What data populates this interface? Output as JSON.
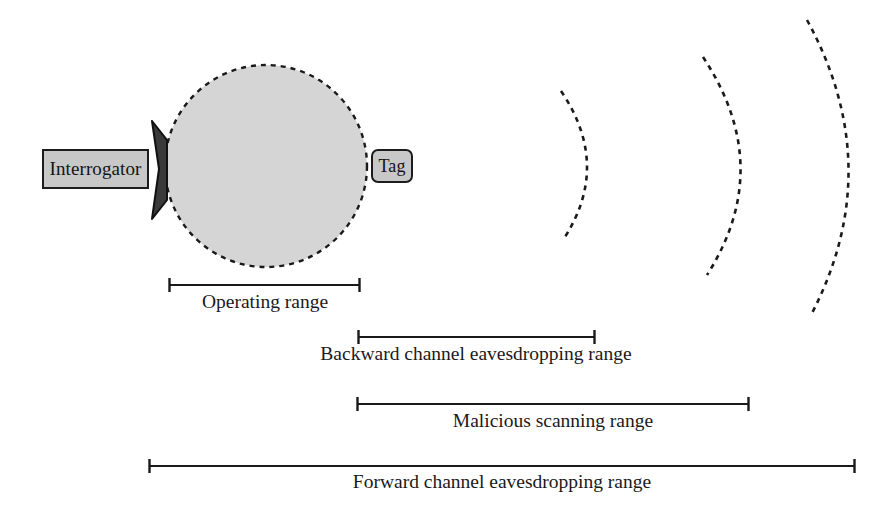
{
  "diagram": {
    "background_color": "#ffffff",
    "line_color": "#1a1a1a",
    "field_fill_color": "#d5d5d5",
    "node_fill_color": "#c8c8c8",
    "node_border_color": "#1c1c1c",
    "nodes": [
      {
        "id": "interrogator",
        "label": "Interrogator",
        "shape": "rectangle"
      },
      {
        "id": "tag",
        "label": "Tag",
        "shape": "rounded-rectangle"
      }
    ],
    "operating_field": {
      "shape": "dashed-circle",
      "center_x": 266,
      "center_y": 166,
      "radius": 101
    },
    "antenna": {
      "shape": "cone",
      "apex_x": 151,
      "apex_y": 169
    },
    "wavefronts": [
      {
        "id": "wavefront-1",
        "peak_x": 596,
        "top_y": 90,
        "bottom_y": 241
      },
      {
        "id": "wavefront-2",
        "peak_x": 751,
        "top_y": 56,
        "bottom_y": 276
      },
      {
        "id": "wavefront-3",
        "peak_x": 856,
        "top_y": 19,
        "bottom_y": 316
      }
    ],
    "ranges": [
      {
        "id": "operating-range",
        "label": "Operating range",
        "start_x": 169,
        "end_x": 360,
        "bar_y": 285
      },
      {
        "id": "backward-channel-eavesdropping-range",
        "label": "Backward channel eavesdropping range",
        "start_x": 358,
        "end_x": 595,
        "bar_y": 337
      },
      {
        "id": "malicious-scanning-range",
        "label": "Malicious scanning range",
        "start_x": 357,
        "end_x": 749,
        "bar_y": 404
      },
      {
        "id": "forward-channel-eavesdropping-range",
        "label": "Forward channel eavesdropping range",
        "start_x": 149,
        "end_x": 855,
        "bar_y": 466
      }
    ]
  }
}
